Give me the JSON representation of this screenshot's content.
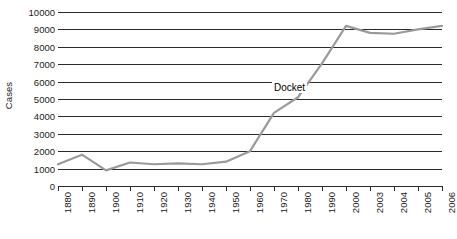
{
  "chart_data": {
    "type": "line",
    "title": "",
    "xlabel": "",
    "ylabel": "Cases",
    "categories": [
      "1880",
      "1890",
      "1900",
      "1910",
      "1920",
      "1930",
      "1940",
      "1950",
      "1960",
      "1970",
      "1980",
      "1990",
      "2000",
      "2003",
      "2004",
      "2005",
      "2006"
    ],
    "series": [
      {
        "name": "Docket",
        "color": "#9a9a9a",
        "values": [
          1250,
          1800,
          900,
          1350,
          1250,
          1300,
          1250,
          1400,
          2000,
          4200,
          5100,
          7050,
          9200,
          8800,
          8750,
          9000,
          9200
        ]
      }
    ],
    "annotations": [
      {
        "text": "Docket",
        "category": "1980",
        "value": 5600
      }
    ],
    "ylim": [
      0,
      10000
    ],
    "yticks": [
      0,
      1000,
      2000,
      3000,
      4000,
      5000,
      6000,
      7000,
      8000,
      9000,
      10000
    ],
    "ytick_labels": [
      "0",
      "1000",
      "2000",
      "3000",
      "4000",
      "5000",
      "6000",
      "7000",
      "8000",
      "9000",
      "10000"
    ],
    "grid": true,
    "grid_axis": "y",
    "legend": false,
    "legend_position": "none",
    "x_tick_label_rotation": 90
  },
  "colors": {
    "background": "#ffffff",
    "grid": "#2b2b2b",
    "axis": "#2b2b2b",
    "series": "#9a9a9a",
    "text": "#1a1a1a"
  }
}
